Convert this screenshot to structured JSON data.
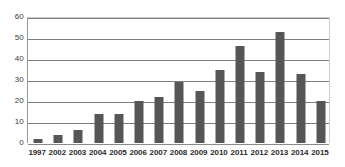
{
  "chart_data": {
    "type": "bar",
    "title": "",
    "subtitle": "",
    "xlabel": "",
    "ylabel": "",
    "categories": [
      "1997",
      "2002",
      "2003",
      "2004",
      "2005",
      "2006",
      "2007",
      "2008",
      "2009",
      "2010",
      "2011",
      "2012",
      "2013",
      "2014",
      "2015"
    ],
    "values": [
      2,
      4,
      6,
      14,
      14,
      20,
      22,
      29,
      25,
      35,
      46,
      34,
      53,
      33,
      20
    ],
    "series": [
      {
        "name": "",
        "values": [
          2,
          4,
          6,
          14,
          14,
          20,
          22,
          29,
          25,
          35,
          46,
          34,
          53,
          33,
          20
        ]
      }
    ],
    "ylim": [
      0,
      60
    ],
    "y_ticks": [
      0,
      10,
      20,
      30,
      40,
      50,
      60
    ],
    "y_tick_labels": [
      "0",
      "10",
      "20",
      "30",
      "40",
      "50",
      "60"
    ],
    "grid": true,
    "grid_axis": "y",
    "legend": false,
    "legend_position": "none",
    "bar_color": "#565656",
    "gridline_color": "#7d7d7d",
    "axis_color": "#9a9a9a",
    "background_color": "#ffffff",
    "annotations": []
  }
}
